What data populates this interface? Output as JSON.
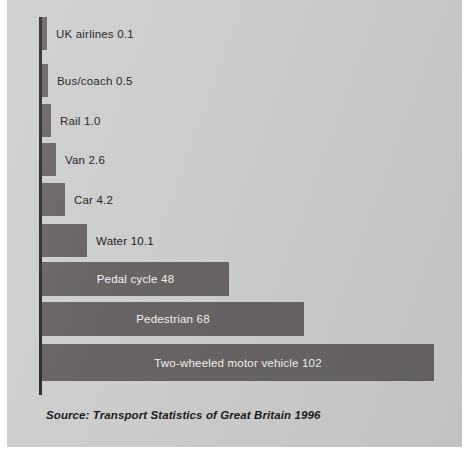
{
  "figure": {
    "background_color": "#cdcdcd",
    "bar_color": "#686464",
    "axis_color": "#2a2a2a",
    "label_color_outside": "#1b1b1b",
    "label_color_inside": "#f2f2f2"
  },
  "source_note": "Source: Transport Statistics of Great Britain 1996",
  "chart_data": {
    "type": "bar",
    "orientation": "horizontal",
    "title": "",
    "subtitle": "",
    "xlabel": "",
    "ylabel": "",
    "grid": false,
    "legend": null,
    "xlim": [
      0,
      102
    ],
    "annotation": "Source: Transport Statistics of Great Britain 1996",
    "categories": [
      "UK airlines",
      "Bus/coach",
      "Rail",
      "Van",
      "Car",
      "Water",
      "Pedal cycle",
      "Pedestrian",
      "Two-wheeled motor vehicle"
    ],
    "values": [
      0.1,
      0.5,
      1.0,
      2.6,
      4.2,
      10.1,
      48,
      68,
      102
    ],
    "value_labels": [
      "0.1",
      "0.5",
      "1.0",
      "2.6",
      "4.2",
      "10.1",
      "48",
      "68",
      "102"
    ],
    "bars": [
      {
        "category": "UK airlines",
        "value": 0.1,
        "value_label": "0.1",
        "label": "UK airlines  0.1",
        "label_placement": "outside",
        "bar_px": {
          "x": 35,
          "y": 17,
          "w": 5,
          "h": 33
        }
      },
      {
        "category": "Bus/coach",
        "value": 0.5,
        "value_label": "0.5",
        "label": "Bus/coach  0.5",
        "label_placement": "outside",
        "bar_px": {
          "x": 35,
          "y": 64,
          "w": 6,
          "h": 33
        }
      },
      {
        "category": "Rail",
        "value": 1.0,
        "value_label": "1.0",
        "label": "Rail  1.0",
        "label_placement": "outside",
        "bar_px": {
          "x": 35,
          "y": 104,
          "w": 9,
          "h": 33
        }
      },
      {
        "category": "Van",
        "value": 2.6,
        "value_label": "2.6",
        "label": "Van  2.6",
        "label_placement": "outside",
        "bar_px": {
          "x": 35,
          "y": 143,
          "w": 14,
          "h": 33
        }
      },
      {
        "category": "Car",
        "value": 4.2,
        "value_label": "4.2",
        "label": "Car  4.2",
        "label_placement": "outside",
        "bar_px": {
          "x": 35,
          "y": 183,
          "w": 23,
          "h": 33
        }
      },
      {
        "category": "Water",
        "value": 10.1,
        "value_label": "10.1",
        "label": "Water  10.1",
        "label_placement": "outside",
        "bar_px": {
          "x": 35,
          "y": 224,
          "w": 45,
          "h": 33
        }
      },
      {
        "category": "Pedal cycle",
        "value": 48,
        "value_label": "48",
        "label": "Pedal cycle  48",
        "label_placement": "inside",
        "bar_px": {
          "x": 35,
          "y": 262,
          "w": 187,
          "h": 34
        }
      },
      {
        "category": "Pedestrian",
        "value": 68,
        "value_label": "68",
        "label": "Pedestrian  68",
        "label_placement": "inside",
        "bar_px": {
          "x": 35,
          "y": 302,
          "w": 262,
          "h": 34
        }
      },
      {
        "category": "Two-wheeled motor vehicle",
        "value": 102,
        "value_label": "102",
        "label": "Two-wheeled motor vehicle 102",
        "label_placement": "inside",
        "bar_px": {
          "x": 35,
          "y": 344,
          "w": 392,
          "h": 37
        }
      }
    ]
  }
}
